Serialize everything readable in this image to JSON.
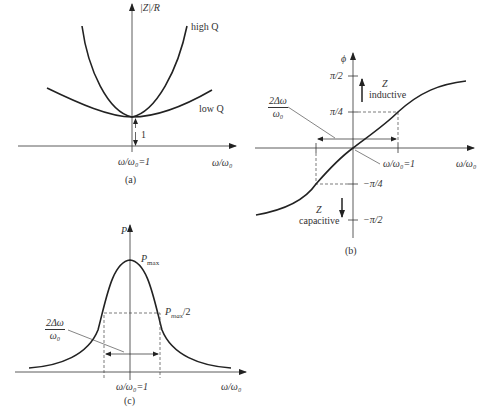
{
  "panel_a": {
    "caption": "(a)",
    "y_label": "|Z|/R",
    "x_label": "ω/ω₀",
    "x_tick": "ω/ω₀=1",
    "curve_high": "high Q",
    "curve_low": "low Q",
    "min_label": "1"
  },
  "panel_b": {
    "caption": "(b)",
    "y_label": "ϕ",
    "x_label": "ω/ω₀",
    "x_tick": "ω/ω₀=1",
    "ticks": {
      "pi2": "π/2",
      "pi4": "π/4",
      "mpi4": "−π/4",
      "mpi2": "−π/2"
    },
    "upper_region": {
      "line1": "Z",
      "line2": "inductive"
    },
    "lower_region": {
      "line1": "Z",
      "line2": "capacitive"
    },
    "bandwidth": {
      "num": "2Δω",
      "den": "ω₀"
    }
  },
  "panel_c": {
    "caption": "(c)",
    "y_label": "P",
    "x_label": "ω/ω₀",
    "x_tick": "ω/ω₀=1",
    "peak_label": "P",
    "peak_sub": "max",
    "half_label": "P",
    "half_sub": "max",
    "half_suffix": "/2",
    "bandwidth": {
      "num": "2Δω",
      "den": "ω₀"
    }
  },
  "colors": {
    "ink": "#222222",
    "background": "#ffffff"
  }
}
